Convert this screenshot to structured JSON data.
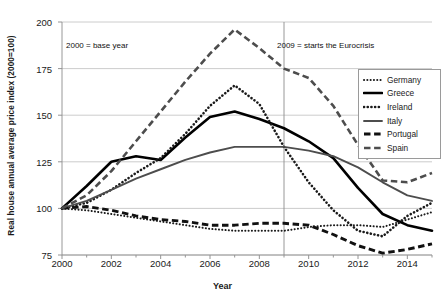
{
  "chart_data": {
    "type": "line",
    "title": "",
    "xlabel": "Year",
    "ylabel": "Real house annual average price index (2000=100)",
    "xlim": [
      2000,
      2015
    ],
    "ylim": [
      75,
      200
    ],
    "yticks": [
      75,
      100,
      125,
      150,
      175,
      200
    ],
    "xticks": [
      2000,
      2002,
      2004,
      2006,
      2008,
      2010,
      2012,
      2014
    ],
    "grid": true,
    "legend_position": "right",
    "x": [
      2000,
      2001,
      2002,
      2003,
      2004,
      2005,
      2006,
      2007,
      2008,
      2009,
      2010,
      2011,
      2012,
      2013,
      2014,
      2015
    ],
    "series": [
      {
        "name": "Germany",
        "style": "dotted",
        "color": "#1a1a1a",
        "values": [
          100,
          99,
          97,
          95,
          93,
          91,
          89,
          88,
          88,
          88,
          90,
          91,
          91,
          90,
          94,
          98
        ]
      },
      {
        "name": "Greece",
        "style": "solid-thick",
        "color": "#000000",
        "values": [
          100,
          112,
          125,
          128,
          126,
          138,
          149,
          152,
          148,
          143,
          136,
          127,
          111,
          97,
          91,
          88
        ]
      },
      {
        "name": "Ireland",
        "style": "dotted-thick",
        "color": "#1a1a1a",
        "values": [
          100,
          103,
          110,
          119,
          127,
          140,
          155,
          166,
          156,
          133,
          114,
          99,
          88,
          85,
          96,
          103
        ]
      },
      {
        "name": "Italy",
        "style": "solid",
        "color": "#4d4d4d",
        "values": [
          100,
          104,
          110,
          116,
          121,
          126,
          130,
          133,
          133,
          133,
          131,
          128,
          122,
          114,
          107,
          104
        ]
      },
      {
        "name": "Portugal",
        "style": "dashed-thick",
        "color": "#111111",
        "values": [
          100,
          101,
          99,
          96,
          94,
          93,
          91,
          91,
          92,
          92,
          91,
          86,
          80,
          76,
          78,
          81
        ]
      },
      {
        "name": "Spain",
        "style": "dashed",
        "color": "#4d4d4d",
        "values": [
          100,
          107,
          120,
          136,
          152,
          168,
          183,
          196,
          186,
          175,
          170,
          155,
          134,
          115,
          114,
          119
        ]
      }
    ],
    "annotations": [
      {
        "text": "2000 =  base year",
        "x": 2000
      },
      {
        "text": "2009 = starts the Eurocrisis",
        "x": 2009
      }
    ],
    "vlines": [
      2000,
      2009
    ]
  }
}
